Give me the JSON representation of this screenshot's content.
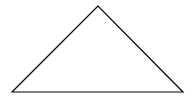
{
  "diagram": {
    "shape": "triangle",
    "stroke_color": "#000000",
    "fill_color": "#ffffff",
    "vertices": [
      [
        98,
        6
      ],
      [
        12,
        92
      ],
      [
        183,
        92
      ]
    ]
  }
}
